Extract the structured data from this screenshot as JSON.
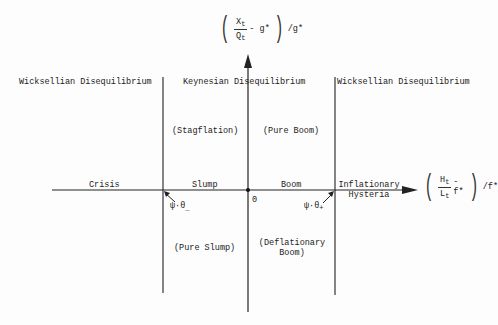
{
  "diagram": {
    "y_axis_label": {
      "num": "X",
      "num_sub": "t",
      "den": "Q",
      "den_sub": "t",
      "minus": "- g*",
      "tail": "/g*"
    },
    "x_axis_label": {
      "num": "H",
      "num_sub": "t",
      "den": "L",
      "den_sub": "t",
      "minus": "- f*",
      "tail": "/f*"
    },
    "origin_label": "0",
    "regions_top": {
      "left": "Wicksellian Disequilibrium",
      "center": "Keynesian Disequilibrium",
      "right": "Wicksellian Disequilibrium"
    },
    "axis_segments": {
      "crisis": "Crisis",
      "slump": "Slump",
      "boom": "Boom",
      "inflationary_1": "Inflationary",
      "inflationary_2": "Hysteria"
    },
    "quadrants": {
      "upper_left": "(Stagflation)",
      "upper_right": "(Pure Boom)",
      "lower_left": "(Pure Slump)",
      "lower_right_1": "(Deflationary",
      "lower_right_2": "Boom)"
    },
    "thresholds": {
      "minus": {
        "base": "ψ·θ",
        "sub": "_"
      },
      "plus": {
        "base": "ψ·θ",
        "sub": "+"
      }
    }
  }
}
